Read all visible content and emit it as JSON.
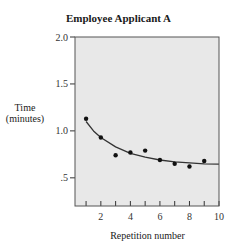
{
  "chart_data": {
    "type": "scatter",
    "title": "Employee Applicant A",
    "xlabel": "Repetition number",
    "ylabel": "Time (minutes)",
    "ylabel_lines": [
      "Time",
      "(minutes)"
    ],
    "xlim": [
      0.25,
      10
    ],
    "ylim": [
      0.2,
      2.0
    ],
    "x_ticks": [
      1,
      2,
      3,
      4,
      5,
      6,
      7,
      8,
      9,
      10
    ],
    "x_tick_labels": [
      {
        "value": 2,
        "label": "2"
      },
      {
        "value": 4,
        "label": "4"
      },
      {
        "value": 6,
        "label": "6"
      },
      {
        "value": 8,
        "label": "8"
      },
      {
        "value": 10,
        "label": "10"
      }
    ],
    "y_ticks": [
      {
        "value": 2.0,
        "label": "2.0"
      },
      {
        "value": 1.5,
        "label": "1.5"
      },
      {
        "value": 1.0,
        "label": "1.0"
      },
      {
        "value": 0.5,
        "label": ".5"
      }
    ],
    "grid": false,
    "series": [
      {
        "name": "observed",
        "type": "scatter",
        "x": [
          1,
          2,
          3,
          4,
          5,
          6,
          7,
          8,
          9
        ],
        "y": [
          1.13,
          0.93,
          0.74,
          0.77,
          0.79,
          0.69,
          0.65,
          0.62,
          0.68
        ]
      },
      {
        "name": "fitted curve",
        "type": "line",
        "x": [
          1,
          1.5,
          2,
          3,
          4,
          5,
          6,
          7,
          8,
          9,
          10
        ],
        "y": [
          1.1,
          1.0,
          0.93,
          0.83,
          0.76,
          0.72,
          0.69,
          0.67,
          0.66,
          0.65,
          0.645
        ]
      }
    ],
    "colors": {
      "plot_background": "#e8e8e8",
      "marks": "#111111",
      "curve": "#333333",
      "frame": "#555555"
    }
  }
}
